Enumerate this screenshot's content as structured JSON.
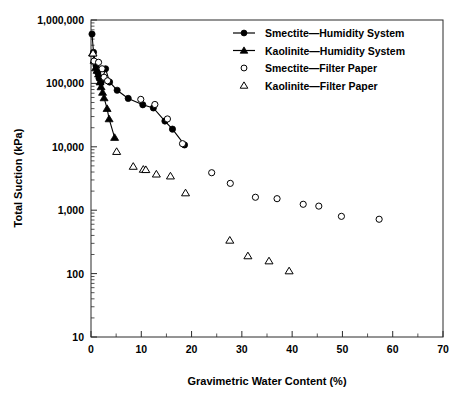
{
  "chart_data": {
    "type": "scatter",
    "title": "",
    "xlabel": "Gravimetric Water Content (%)",
    "ylabel": "Total Suction (kPa)",
    "xlim": [
      0,
      70
    ],
    "ylim": [
      10,
      1000000
    ],
    "yscale": "log",
    "xscale": "linear",
    "grid": false,
    "legend_position": "top-right",
    "xticks": [
      "0",
      "10",
      "20",
      "30",
      "40",
      "50",
      "60",
      "70"
    ],
    "xtick_values": [
      0,
      10,
      20,
      30,
      40,
      50,
      60,
      70
    ],
    "yticks": [
      "10",
      "100",
      "1,000",
      "10,000",
      "100,000",
      "1,000,000"
    ],
    "ytick_values": [
      10,
      100,
      1000,
      10000,
      100000,
      1000000
    ],
    "series": [
      {
        "name": "Smectite—Humidity System",
        "marker": "filled-circle",
        "line": true,
        "points": [
          [
            0.2,
            600000
          ],
          [
            0.5,
            310000
          ],
          [
            1.0,
            190000
          ],
          [
            1.3,
            150000
          ],
          [
            1.6,
            120000
          ],
          [
            2.0,
            103000
          ],
          [
            2.9,
            170000
          ],
          [
            3.7,
            105000
          ],
          [
            5.2,
            78000
          ],
          [
            7.4,
            58000
          ],
          [
            10.3,
            46000
          ],
          [
            12.4,
            41000
          ],
          [
            14.7,
            25500
          ],
          [
            16.2,
            19000
          ],
          [
            18.6,
            10700
          ]
        ]
      },
      {
        "name": "Kaolinite—Humidity System",
        "marker": "filled-triangle",
        "line": true,
        "points": [
          [
            0.3,
            300000
          ],
          [
            0.6,
            230000
          ],
          [
            0.9,
            175000
          ],
          [
            1.2,
            160000
          ],
          [
            1.5,
            140000
          ],
          [
            1.8,
            105000
          ],
          [
            2.0,
            88000
          ],
          [
            2.3,
            72000
          ],
          [
            2.6,
            59000
          ],
          [
            3.2,
            40000
          ],
          [
            3.6,
            27500
          ],
          [
            4.7,
            14000
          ]
        ]
      },
      {
        "name": "Smectite—Filter Paper",
        "marker": "open-circle",
        "line": false,
        "points": [
          [
            0.6,
            225000
          ],
          [
            1.5,
            215000
          ],
          [
            2.2,
            170000
          ],
          [
            2.6,
            125000
          ],
          [
            3.3,
            110000
          ],
          [
            9.9,
            56000
          ],
          [
            12.7,
            46500
          ],
          [
            15.2,
            27500
          ],
          [
            18.2,
            11200
          ],
          [
            24.0,
            3900
          ],
          [
            27.7,
            2650
          ],
          [
            32.7,
            1600
          ],
          [
            37.0,
            1520
          ],
          [
            42.2,
            1240
          ],
          [
            45.3,
            1160
          ],
          [
            49.8,
            800
          ],
          [
            57.3,
            720
          ]
        ]
      },
      {
        "name": "Kaolinite—Filter Paper",
        "marker": "open-triangle",
        "line": false,
        "points": [
          [
            0.4,
            300000
          ],
          [
            5.1,
            8400
          ],
          [
            8.4,
            4900
          ],
          [
            10.4,
            4400
          ],
          [
            10.9,
            4350
          ],
          [
            13.0,
            3700
          ],
          [
            15.8,
            3450
          ],
          [
            18.8,
            1870
          ],
          [
            27.6,
            335
          ],
          [
            31.2,
            190
          ],
          [
            35.4,
            158
          ],
          [
            39.4,
            110
          ]
        ]
      }
    ]
  },
  "legend": {
    "items": [
      {
        "label": "Smectite—Humidity System",
        "marker": "filled-circle",
        "line": true
      },
      {
        "label": "Kaolinite—Humidity System",
        "marker": "filled-triangle",
        "line": true
      },
      {
        "label": "Smectite—Filter Paper",
        "marker": "open-circle",
        "line": false
      },
      {
        "label": "Kaolinite—Filter Paper",
        "marker": "open-triangle",
        "line": false
      }
    ]
  },
  "colors": {
    "ink": "#000000",
    "axis": "#2b2b2b",
    "background": "#ffffff"
  }
}
